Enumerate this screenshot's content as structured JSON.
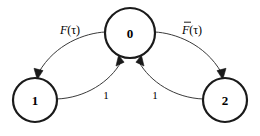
{
  "diagram": {
    "type": "state-transition-diagram",
    "background_color": "#ffffff",
    "node_stroke_color": "#1a1a1a",
    "edge_stroke_color": "#3a3a3a",
    "text_color": "#000000",
    "nodes": [
      {
        "id": "0",
        "label": "0",
        "cx": 130,
        "cy": 33,
        "r": 25
      },
      {
        "id": "1",
        "label": "1",
        "cx": 35,
        "cy": 100,
        "r": 22
      },
      {
        "id": "2",
        "label": "2",
        "cx": 225,
        "cy": 100,
        "r": 22
      }
    ],
    "edges": [
      {
        "id": "edge-0-to-1",
        "from": "0",
        "to": "1",
        "label_text": "F(τ)",
        "label_base": "F",
        "label_arg": "(τ)",
        "has_overbar": false,
        "label_x": 70,
        "label_y": 30
      },
      {
        "id": "edge-0-to-2",
        "from": "0",
        "to": "2",
        "label_text": "F̄(τ)",
        "label_base": "F",
        "label_arg": "(τ)",
        "has_overbar": true,
        "label_x": 192,
        "label_y": 30
      },
      {
        "id": "edge-1-to-0",
        "from": "1",
        "to": "0",
        "label_text": "1",
        "label_base": "1",
        "label_arg": "",
        "has_overbar": false,
        "label_x": 106,
        "label_y": 95
      },
      {
        "id": "edge-2-to-0",
        "from": "2",
        "to": "0",
        "label_text": "1",
        "label_base": "1",
        "label_arg": "",
        "has_overbar": false,
        "label_x": 155,
        "label_y": 95
      }
    ]
  }
}
